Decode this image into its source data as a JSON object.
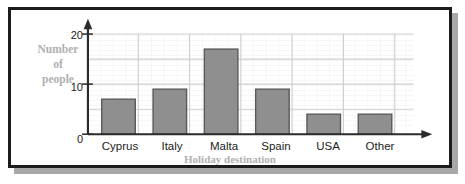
{
  "chart_data": {
    "type": "bar",
    "title": "",
    "xlabel": "Holiday destination",
    "ylabel": "Number of people",
    "ylabel_lines": [
      "Number",
      "of",
      "people"
    ],
    "categories": [
      "Cyprus",
      "Italy",
      "Malta",
      "Spain",
      "USA",
      "Other"
    ],
    "values": [
      5,
      7,
      9,
      17,
      9,
      4
    ],
    "ylim": [
      0,
      20
    ],
    "yticks": [
      0,
      10,
      20
    ],
    "ytick_labels": [
      "0",
      "10",
      "20"
    ],
    "minor_gridline_step": 1,
    "major_gridline_step": 5,
    "grid": true,
    "legend": null,
    "colors": {
      "bar_fill": "#8f8f8f",
      "bar_stroke": "#595959",
      "axis": "#2b2b2b",
      "label_gray": "#b0b0b0",
      "grid_minor": "#e9e9e9",
      "grid_major": "#cfcfcf",
      "frame": "#1c1c1c",
      "shadow": "#a8a8a8"
    }
  }
}
